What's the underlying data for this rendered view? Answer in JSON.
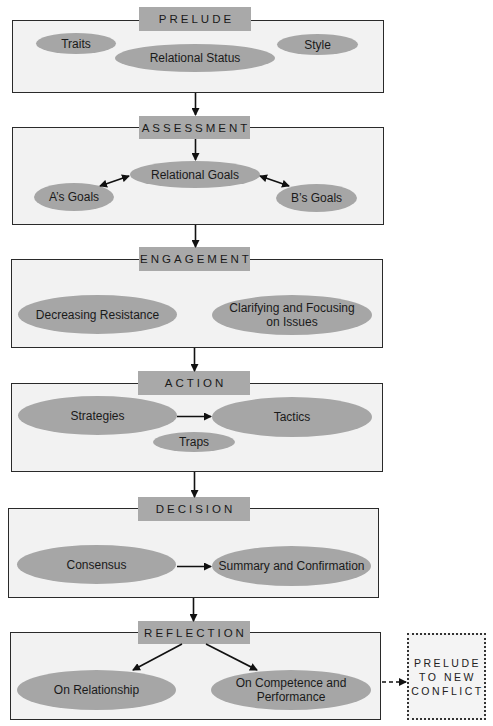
{
  "diagram": {
    "stages": [
      {
        "title": "PRELUDE",
        "nodes": [
          "Traits",
          "Relational Status",
          "Style"
        ]
      },
      {
        "title": "ASSESSMENT",
        "nodes": [
          "Relational Goals",
          "A’s Goals",
          "B’s Goals"
        ]
      },
      {
        "title": "ENGAGEMENT",
        "nodes": [
          "Decreasing Resistance",
          "Clarifying and Focusing on Issues"
        ],
        "node_lines": {
          "clarifying_1": "Clarifying and Focusing",
          "clarifying_2": "on Issues"
        }
      },
      {
        "title": "ACTION",
        "nodes": [
          "Strategies",
          "Tactics",
          "Traps"
        ]
      },
      {
        "title": "DECISION",
        "nodes": [
          "Consensus",
          "Summary and Confirmation"
        ]
      },
      {
        "title": "REFLECTION",
        "nodes": [
          "On Relationship",
          "On Competence and Performance"
        ],
        "node_lines": {
          "competence_1": "On Competence and",
          "competence_2": "Performance"
        }
      }
    ],
    "next": {
      "lines": [
        "PRELUDE",
        "TO NEW",
        "CONFLICT"
      ]
    },
    "colors": {
      "panel_bg": "#f2f2f2",
      "panel_border": "#2a2a2a",
      "tab_bg": "#a9a9a9",
      "oval_bg": "#a6a6a6",
      "arrow": "#111111"
    }
  }
}
